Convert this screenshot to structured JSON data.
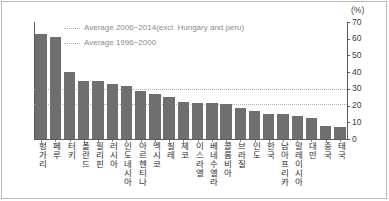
{
  "chart_data": {
    "type": "bar",
    "title": "",
    "xlabel": "",
    "ylabel": "",
    "unit_label": "(%)",
    "ylim": [
      0,
      70
    ],
    "ytick_values": [
      0,
      10,
      20,
      30,
      40,
      50,
      60,
      70
    ],
    "ytick_labels": [
      "0",
      "10",
      "20",
      "30",
      "40",
      "50",
      "60",
      "70"
    ],
    "yaxis_position": "right",
    "grid": false,
    "legend_position": "top-left-inside",
    "categories": [
      "헝가리",
      "페루",
      "터키",
      "폴란드",
      "필리핀",
      "러시아",
      "인도네시아",
      "아르헨티나",
      "멕시코",
      "칠레",
      "체코",
      "이스라엘",
      "베네수엘라",
      "콜롬비아",
      "브라질",
      "인도",
      "한국",
      "남아프리카",
      "말레이시아",
      "대만",
      "중국",
      "태국"
    ],
    "values": [
      63,
      61,
      40,
      35,
      34.5,
      33,
      31.5,
      28.5,
      27,
      25,
      22,
      21.5,
      21.5,
      21,
      18.5,
      16.5,
      15,
      15,
      13.5,
      12.5,
      7.5,
      7
    ],
    "series_color": "#6f6f6f",
    "reference_lines": [
      {
        "label": "Average 2006~2014(excl. Hungary and peru)",
        "value": 30,
        "style": "dotted",
        "color": "#b0b0b0"
      },
      {
        "label": "Average 1996~2000",
        "value": 21,
        "style": "dotted",
        "color": "#b0b0b0"
      }
    ],
    "legend": [
      "Average 2006~2014(excl. Hungary and peru)",
      "Average 1996~2000"
    ]
  }
}
